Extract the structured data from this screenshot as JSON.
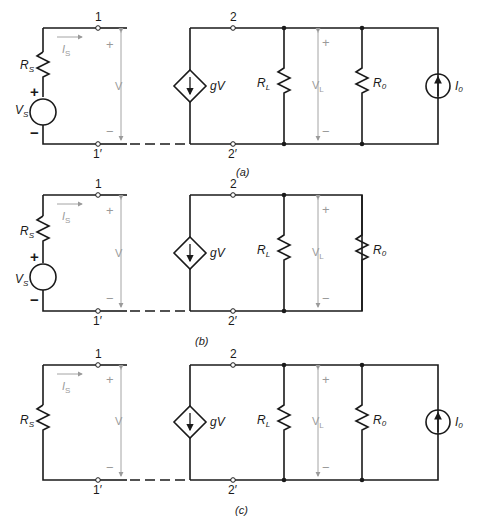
{
  "figure": {
    "panels": [
      {
        "id": "a",
        "caption": "(a)",
        "source": {
          "resistor": "R",
          "resistor_sub": "S",
          "voltage": "V",
          "voltage_sub": "S",
          "plus": "+",
          "minus": "−",
          "present": true
        },
        "current": {
          "label": "I",
          "sub": "S"
        },
        "port1": {
          "top": "1",
          "bottom": "1′",
          "voltage": "V",
          "plus": "+",
          "minus": "−"
        },
        "dep_source": {
          "label": "gV"
        },
        "port2": {
          "top": "2",
          "bottom": "2′"
        },
        "load": {
          "label": "R",
          "sub": "L",
          "voltage": "V",
          "voltage_sub": "L",
          "plus": "+",
          "minus": "−"
        },
        "output_res": {
          "label": "R",
          "sub": "0"
        },
        "current_source": {
          "label": "I",
          "sub": "0",
          "present": true
        }
      },
      {
        "id": "b",
        "caption": "(b)",
        "source": {
          "resistor": "R",
          "resistor_sub": "S",
          "voltage": "V",
          "voltage_sub": "S",
          "plus": "+",
          "minus": "−",
          "present": true
        },
        "current": {
          "label": "I",
          "sub": "S"
        },
        "port1": {
          "top": "1",
          "bottom": "1′",
          "voltage": "V",
          "plus": "+",
          "minus": "−"
        },
        "dep_source": {
          "label": "gV"
        },
        "port2": {
          "top": "2",
          "bottom": "2′"
        },
        "load": {
          "label": "R",
          "sub": "L",
          "voltage": "V",
          "voltage_sub": "L",
          "plus": "+",
          "minus": "−"
        },
        "output_res": {
          "label": "R",
          "sub": "0"
        },
        "current_source": {
          "present": false
        }
      },
      {
        "id": "c",
        "caption": "(c)",
        "source": {
          "resistor": "R",
          "resistor_sub": "S",
          "present": false
        },
        "current": {
          "label": "I",
          "sub": "S"
        },
        "port1": {
          "top": "1",
          "bottom": "1′",
          "voltage": "V",
          "plus": "+",
          "minus": "−"
        },
        "dep_source": {
          "label": "gV"
        },
        "port2": {
          "top": "2",
          "bottom": "2′"
        },
        "load": {
          "label": "R",
          "sub": "L",
          "voltage": "V",
          "voltage_sub": "L",
          "plus": "+",
          "minus": "−"
        },
        "output_res": {
          "label": "R",
          "sub": "0"
        },
        "current_source": {
          "label": "I",
          "sub": "0",
          "present": true
        }
      }
    ]
  }
}
